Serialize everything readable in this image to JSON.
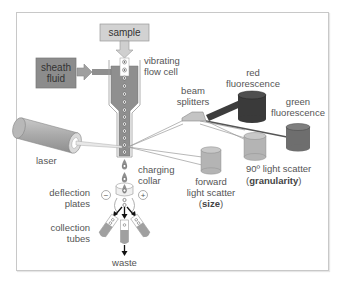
{
  "diagram": {
    "colors": {
      "frame_border": "#c8c8c8",
      "sample_box": "#d2d2d2",
      "sheath_box": "#8c8c8c",
      "flow_cell": "#8f8f8f",
      "red_detector": "#3a3a3a",
      "green_detector": "#6e6e6e",
      "scatter_detector": "#b4b4b4",
      "laser": "#a8a8a8",
      "label_text": "#555555"
    },
    "labels": {
      "sample": "sample",
      "sheath_line1": "sheath",
      "sheath_line2": "fluid",
      "vibrating_line1": "vibrating",
      "vibrating_line2": "flow cell",
      "beam_line1": "beam",
      "beam_line2": "splitters",
      "red_line1": "red",
      "red_line2": "fluorescence",
      "green_line1": "green",
      "green_line2": "fluorescence",
      "laser": "laser",
      "charging_line1": "charging",
      "charging_line2": "collar",
      "deflection_line1": "deflection",
      "deflection_line2": "plates",
      "collection_line1": "collection",
      "collection_line2": "tubes",
      "waste": "waste",
      "forward_line1": "forward",
      "forward_line2": "light scatter",
      "forward_paren_open": "(",
      "forward_bold": "size",
      "forward_paren_close": ")",
      "side_line1": "90º light scatter",
      "side_paren_open": "(",
      "side_bold": "granularity",
      "side_paren_close": ")",
      "minus": "−",
      "plus": "+"
    }
  }
}
